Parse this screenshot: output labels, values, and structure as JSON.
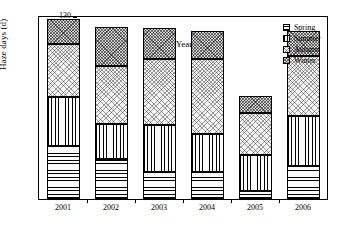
{
  "chart_data": {
    "type": "bar",
    "stacked": true,
    "title": "",
    "xlabel": "Year",
    "ylabel": "Haze days (d)",
    "categories": [
      "2001",
      "2002",
      "2003",
      "2004",
      "2005",
      "2006"
    ],
    "ylim": [
      10,
      130
    ],
    "yticks": [
      10,
      20,
      30,
      40,
      50,
      60,
      70,
      80,
      90,
      100,
      110,
      120,
      130
    ],
    "ytick_labels": [
      "10",
      "20",
      "30",
      "40",
      "50",
      "60",
      "70",
      "80",
      "90",
      "100",
      "110",
      "120",
      "130"
    ],
    "grid": false,
    "legend_position": "top-right",
    "series": [
      {
        "name": "Spring",
        "pattern": "horizontal-lines",
        "values": [
          35,
          26.5,
          17.5,
          18,
          5,
          21.5
        ]
      },
      {
        "name": "Summer",
        "pattern": "vertical-lines",
        "values": [
          32.5,
          23,
          31,
          25,
          24,
          33
        ]
      },
      {
        "name": "Autumn",
        "pattern": "light-crosshatch",
        "values": [
          34.5,
          38.5,
          44,
          49.5,
          28,
          39.5
        ]
      },
      {
        "name": "Winter",
        "pattern": "dark-crosshatch",
        "values": [
          17,
          25.5,
          20,
          18.5,
          11,
          16.5
        ]
      }
    ],
    "cumulative_tops": {
      "2001": [
        45,
        77.5,
        112,
        129
      ],
      "2002": [
        36.5,
        59.5,
        98,
        123.5
      ],
      "2003": [
        27.5,
        58.5,
        102.5,
        122.5
      ],
      "2004": [
        28,
        53,
        102.5,
        121
      ],
      "2005": [
        15,
        39,
        67,
        78
      ],
      "2006": [
        31.5,
        64.5,
        104,
        120.5
      ]
    },
    "totals": [
      129,
      123.5,
      122.5,
      121,
      78,
      120.5
    ]
  },
  "legend": {
    "items": [
      {
        "label": "Spring"
      },
      {
        "label": "Summer"
      },
      {
        "label": "Autumn"
      },
      {
        "label": "Winter"
      }
    ]
  },
  "axes": {
    "y_title": "Haze days (d)",
    "x_title": "Year"
  }
}
